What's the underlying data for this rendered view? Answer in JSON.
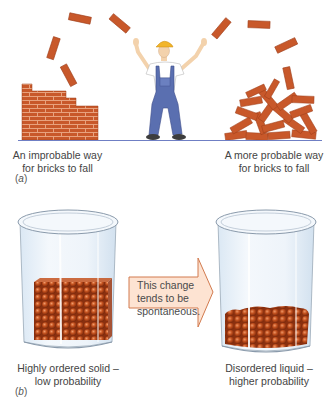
{
  "figure": {
    "part_a": {
      "label": "(a)",
      "label_letter": "a",
      "left_caption": [
        "An improbable way",
        "for bricks to fall"
      ],
      "right_caption": [
        "A more probable way",
        "for bricks to fall"
      ],
      "scene": {
        "left": "ordered brick wall",
        "center": "construction worker tossing bricks",
        "right": "disordered brick pile"
      }
    },
    "part_b": {
      "label": "(b)",
      "label_letter": "b",
      "arrow_text": [
        "This change",
        "tends to be",
        "spontaneous."
      ],
      "left_caption": [
        "Highly ordered solid –",
        "low probability"
      ],
      "right_caption": [
        "Disordered liquid –",
        "higher probability"
      ],
      "scene": {
        "left": "beaker with ordered cube of spheres",
        "right": "beaker with disordered layer of spheres"
      }
    }
  },
  "colors": {
    "brick": "#c8582a",
    "brick_dark": "#9e3e1a",
    "mortar": "#e8a27e",
    "ground_line": "#6f7fc4",
    "overalls": "#5a6fb0",
    "hard_hat": "#f2b52a",
    "skin": "#f3d2ac",
    "sphere": "#b8461c",
    "arrow_fill": "#fde3d2",
    "arrow_stroke": "#d27a4e",
    "glass": "#e9f2fa",
    "glass_stroke": "#9aa9b8"
  }
}
